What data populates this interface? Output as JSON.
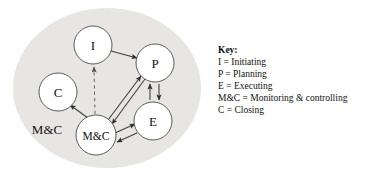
{
  "figure": {
    "backdrop_color": "#e8e6e3",
    "page_background": "#ffffff",
    "node_stroke_color": "#4a4a4a",
    "edge_color": "#3c3c3c",
    "dashed_edge_color": "#6b6b6b"
  },
  "diagram": {
    "nodes": [
      {
        "id": "I",
        "label": "I",
        "cx": 93,
        "cy": 45,
        "r": 19
      },
      {
        "id": "P",
        "label": "P",
        "cx": 155,
        "cy": 63,
        "r": 19
      },
      {
        "id": "E",
        "label": "E",
        "cx": 153,
        "cy": 121,
        "r": 19
      },
      {
        "id": "MC",
        "label": "M&C",
        "cx": 96,
        "cy": 135,
        "r": 20
      },
      {
        "id": "C",
        "label": "C",
        "cx": 58,
        "cy": 92,
        "r": 19
      }
    ],
    "free_labels": [
      {
        "id": "mc-outside",
        "text": "M&C",
        "x": 47,
        "y": 129
      }
    ],
    "edges": [
      {
        "from": "I",
        "to": "P",
        "style": "solid",
        "arrows": "single"
      },
      {
        "from": "MC",
        "to": "I",
        "style": "dashed",
        "arrows": "single"
      },
      {
        "from": "MC",
        "to": "C",
        "style": "solid",
        "arrows": "single"
      },
      {
        "from": "MC",
        "to": "P",
        "style": "solid",
        "arrows": "double"
      },
      {
        "from": "MC",
        "to": "E",
        "style": "solid",
        "arrows": "double"
      },
      {
        "from": "P",
        "to": "E",
        "style": "solid",
        "arrows": "double"
      }
    ]
  },
  "key": {
    "title": "Key:",
    "entries": [
      "I = Initiating",
      "P = Planning",
      "E = Executing",
      "M&C = Monitoring & controlling",
      "C = Closing"
    ]
  }
}
